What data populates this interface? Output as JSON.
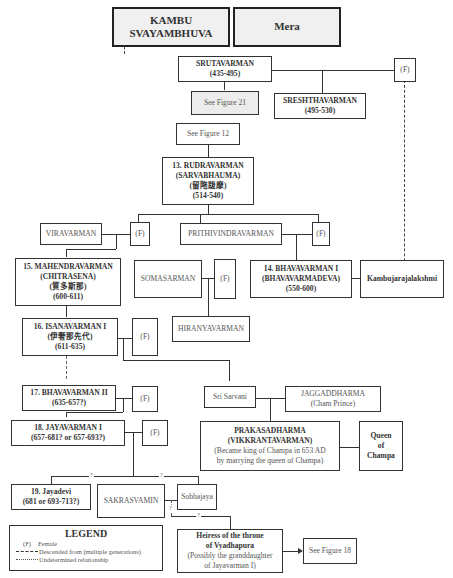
{
  "diagram": {
    "type": "genealogy",
    "nodes": {
      "kambu": {
        "line1": "KAMBU",
        "line2": "SVAYAMBHUVA"
      },
      "mera": {
        "label": "Mera"
      },
      "srutavarman": {
        "name": "SRUTAVARMAN",
        "dates": "(435-495)"
      },
      "sruta_wife": {
        "label": "(F)"
      },
      "see_fig21": {
        "label": "See Figure 21"
      },
      "sreshthavarman": {
        "name": "SRESHTHAVARMAN",
        "dates": "(495-530)"
      },
      "see_fig12": {
        "label": "See Figure 12"
      },
      "rudravarman": {
        "name": "13. RUDRAVARMAN",
        "alias": "(SARVABHAUMA)",
        "chinese": "(留陁跋摩)",
        "dates": "(514-540)"
      },
      "viravarman": {
        "name": "VIRAVARMAN"
      },
      "vira_wife": {
        "label": "(F)"
      },
      "prithivindravarman": {
        "name": "PRITHIVINDRAVARMAN"
      },
      "prithi_wife": {
        "label": "(F)"
      },
      "mahendravarman": {
        "name": "15. MAHENDRAVARMAN",
        "alias": "(CHITRASENA)",
        "chinese": "(質多斯那)",
        "dates": "(600-611)"
      },
      "somasarman": {
        "name": "SOMASARMAN"
      },
      "soma_wife": {
        "label": "(F)"
      },
      "bhavavarman1": {
        "name": "14. BHAVAVARMAN I",
        "alias": "(BHAVAVARMADEVA)",
        "dates": "(550-600)"
      },
      "kambujarajalakshmi": {
        "name": "Kambujarajalakshmi"
      },
      "hiranyavarman": {
        "name": "HIRANYAVARMAN"
      },
      "isanavarman1": {
        "name": "16. ISANAVARMAN I",
        "chinese": "(伊奢那先代)",
        "dates": "(611-635)"
      },
      "isana_wife": {
        "label": "(F)"
      },
      "bhavavarman2": {
        "name": "17. BHAVAVARMAN II",
        "dates": "(635-657?)"
      },
      "bhava2_wife": {
        "label": "(F)"
      },
      "sri_sarvani": {
        "name": "Sri Sarvani"
      },
      "jaggaddharma": {
        "name": "JAGGADDHARMA",
        "note": "(Cham Prince)"
      },
      "jayavarman1": {
        "name": "18. JAYAVARMAN I",
        "dates": "(657-681? or 657-693?)"
      },
      "jaya_wife": {
        "label": "(F)"
      },
      "prakasadharma": {
        "name": "PRAKASADHARMA",
        "alias": "(VIKKRANTAVARMAN)",
        "note1": "(Became king of Champa in 653 AD",
        "note2": "by marrying the queen of Champa)"
      },
      "queen_champa": {
        "line1": "Queen",
        "line2": "of",
        "line3": "Champa"
      },
      "jayadevi": {
        "name": "19. Jayadevi",
        "dates": "(681 or 693-713?)"
      },
      "sakrasvamin": {
        "name": "SAKRASVAMIN"
      },
      "sobhajaya": {
        "name": "Sobhajaya"
      },
      "heiress": {
        "line1": "Heiress of the throne",
        "line2": "of Vyadhapura",
        "note1": "(Possibly the granddaughter",
        "note2": "of Jayavarman I)"
      },
      "see_fig18": {
        "label": "See Figure 18"
      }
    },
    "question_marks": [
      "?",
      "?",
      "?",
      "?"
    ],
    "legend": {
      "title": "LEGEND",
      "items": [
        {
          "symbol": "(F)",
          "label": "Female"
        },
        {
          "symbol": "------",
          "label": "Descended from (multiple generations)"
        },
        {
          "symbol": "- · - ·",
          "label": "Undetermined relationship"
        }
      ]
    }
  }
}
